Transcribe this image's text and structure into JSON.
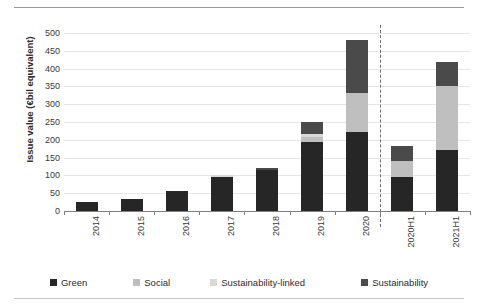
{
  "chart_data": {
    "type": "bar",
    "title": "",
    "subtitle": "",
    "xlabel": "",
    "ylabel": "Issue value (€bil equivalent)",
    "ylim": [
      0,
      500
    ],
    "ytick_step": 50,
    "yticks": [
      "0",
      "50",
      "100",
      "150",
      "200",
      "250",
      "300",
      "350",
      "400",
      "450",
      "500"
    ],
    "grid": true,
    "stacked": true,
    "legend_position": "bottom",
    "categories": [
      "2014",
      "2015",
      "2016",
      "2017",
      "2018",
      "2019",
      "2020",
      "2020H1",
      "2021H1"
    ],
    "series": [
      {
        "name": "Green",
        "color": "#262626",
        "values": [
          25,
          33,
          55,
          96,
          115,
          195,
          222,
          95,
          170
        ]
      },
      {
        "name": "Social",
        "color": "#bfbfbf",
        "values": [
          0,
          0,
          0,
          0,
          0,
          12,
          110,
          45,
          180
        ]
      },
      {
        "name": "Sustainability-linked",
        "color": "#d9d9d9",
        "values": [
          0,
          0,
          0,
          5,
          0,
          8,
          0,
          0,
          0
        ]
      },
      {
        "name": "Sustainability",
        "color": "#4a4a4a",
        "values": [
          0,
          0,
          0,
          0,
          7,
          35,
          148,
          42,
          70
        ]
      }
    ],
    "totals": [
      25,
      33,
      55,
      101,
      122,
      250,
      480,
      182,
      420
    ],
    "annotations": [
      {
        "type": "vertical-dashed-line",
        "after_category": "2020",
        "label": ""
      }
    ]
  },
  "legend": {
    "items": [
      {
        "label": "Green",
        "color": "#262626"
      },
      {
        "label": "Social",
        "color": "#bfbfbf"
      },
      {
        "label": "Sustainability-linked",
        "color": "#d9d9d9"
      },
      {
        "label": "Sustainability",
        "color": "#4a4a4a"
      }
    ]
  }
}
